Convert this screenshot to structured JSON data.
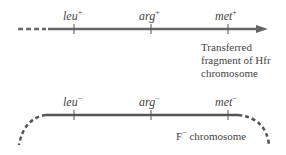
{
  "hfr_fragment": {
    "genes": [
      {
        "name": "leu",
        "allele": "+"
      },
      {
        "name": "arg",
        "allele": "+"
      },
      {
        "name": "met",
        "allele": "+"
      }
    ],
    "caption_line1": "Transferred",
    "caption_line2": "fragment of Hfr",
    "caption_line3": "chromosome"
  },
  "f_minus": {
    "genes": [
      {
        "name": "leu",
        "allele": "−"
      },
      {
        "name": "arg",
        "allele": "−"
      },
      {
        "name": "met",
        "allele": "−"
      }
    ],
    "caption_prefix": "F",
    "caption_sup": "−",
    "caption_rest": " chromosome"
  },
  "colors": {
    "line": "#666666",
    "text": "#444444"
  }
}
